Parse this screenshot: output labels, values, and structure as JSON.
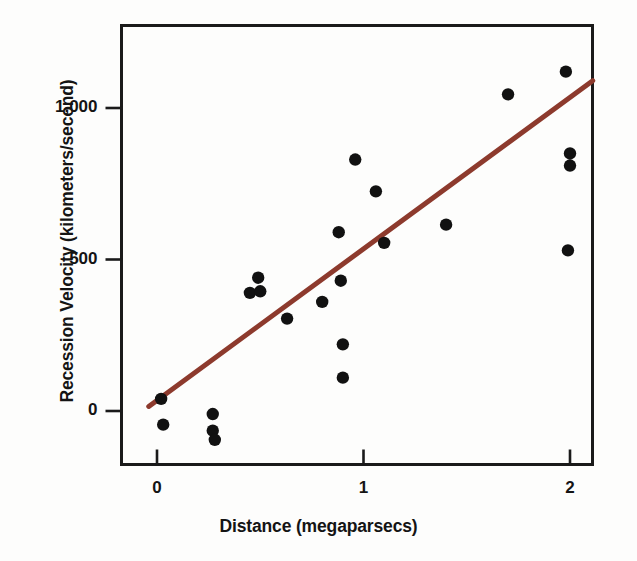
{
  "chart_data": {
    "type": "scatter",
    "title": "",
    "xlabel": "Distance (megaparsecs)",
    "ylabel": "Recession Velocity (kilometers/second)",
    "xlim": [
      -0.05,
      2.12
    ],
    "ylim": [
      -170,
      1270
    ],
    "xticks": [
      0,
      1,
      2
    ],
    "xtick_labels": [
      "0",
      "1",
      "2"
    ],
    "yticks": [
      0,
      500,
      1000
    ],
    "ytick_labels": [
      "0",
      "500",
      "1,000"
    ],
    "grid": false,
    "legend": "none",
    "marker_color": "#111111",
    "frame_color": "#1a1a1a",
    "points": [
      {
        "x": 0.02,
        "y": 40
      },
      {
        "x": 0.03,
        "y": -45
      },
      {
        "x": 0.27,
        "y": -10
      },
      {
        "x": 0.27,
        "y": -65
      },
      {
        "x": 0.28,
        "y": -95
      },
      {
        "x": 0.45,
        "y": 390
      },
      {
        "x": 0.49,
        "y": 440
      },
      {
        "x": 0.5,
        "y": 395
      },
      {
        "x": 0.63,
        "y": 305
      },
      {
        "x": 0.8,
        "y": 360
      },
      {
        "x": 0.88,
        "y": 590
      },
      {
        "x": 0.89,
        "y": 430
      },
      {
        "x": 0.9,
        "y": 220
      },
      {
        "x": 0.9,
        "y": 110
      },
      {
        "x": 0.96,
        "y": 830
      },
      {
        "x": 1.06,
        "y": 725
      },
      {
        "x": 1.1,
        "y": 555
      },
      {
        "x": 1.4,
        "y": 615
      },
      {
        "x": 1.7,
        "y": 1045
      },
      {
        "x": 1.98,
        "y": 1120
      },
      {
        "x": 2.0,
        "y": 850
      },
      {
        "x": 2.0,
        "y": 810
      },
      {
        "x": 1.99,
        "y": 530
      }
    ],
    "fit_line": {
      "color": "#8d3a2d",
      "x_start": -0.04,
      "y_start": 15,
      "x_end": 2.11,
      "y_end": 1090,
      "width": 5
    }
  }
}
